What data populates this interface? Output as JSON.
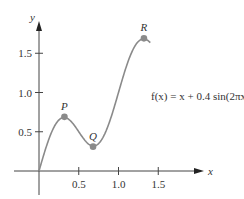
{
  "chart_data": {
    "type": "line",
    "title": "",
    "function_label": "f(x) = x + 0.4 sin(2πx)",
    "xlabel": "x",
    "ylabel": "y",
    "x_ticks": [
      "0.5",
      "1.0",
      "1.5"
    ],
    "y_ticks": [
      "0.5",
      "1.0",
      "1.5"
    ],
    "xlim": [
      -0.3,
      1.85
    ],
    "ylim": [
      -0.3,
      2.15
    ],
    "domain": [
      0,
      1.4
    ],
    "points": [
      {
        "label": "P",
        "x": 0.32,
        "y": 0.69
      },
      {
        "label": "Q",
        "x": 0.68,
        "y": 0.31
      },
      {
        "label": "R",
        "x": 1.32,
        "y": 1.69
      }
    ],
    "grid": false,
    "curve_color": "#8a8a8a",
    "point_color": "#8a8a8a"
  }
}
